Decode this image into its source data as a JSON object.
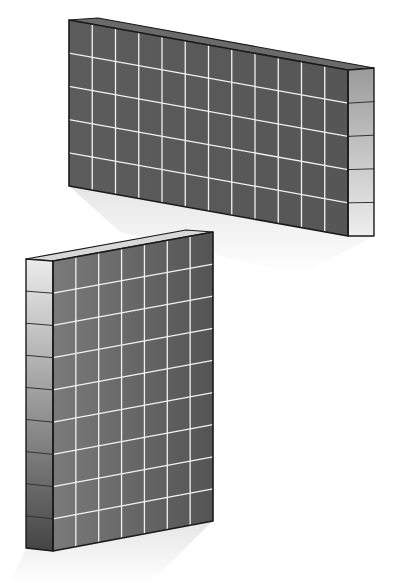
{
  "figure": {
    "width": 400,
    "height": 583,
    "background": "#ffffff",
    "outline_color": "#1a1a1a",
    "grid_line_color": "#f2f2f2",
    "side_divider_color": "#333333"
  },
  "panels": [
    {
      "id": "landscape-panel",
      "orientation": "landscape",
      "columns": 12,
      "rows": 5,
      "front": {
        "tl": [
          69,
          20
        ],
        "tr": [
          348,
          70
        ],
        "br": [
          348,
          236
        ],
        "bl": [
          69,
          186
        ],
        "fill_start": "#5c5c5c",
        "fill_end": "#565656"
      },
      "top_edge": {
        "points": [
          [
            69,
            20
          ],
          [
            98,
            18
          ],
          [
            374,
            68
          ],
          [
            348,
            70
          ]
        ],
        "fill": "#6a6a6a"
      },
      "side": {
        "position": "right",
        "tl": [
          348,
          70
        ],
        "tr": [
          374,
          68
        ],
        "br": [
          374,
          236
        ],
        "bl": [
          348,
          236
        ],
        "segments": 5,
        "fill_top": "#9a9a9a",
        "fill_bottom": "#eeeeee"
      },
      "shadow": {
        "points": [
          [
            69,
            186
          ],
          [
            348,
            236
          ],
          [
            374,
            236
          ],
          [
            300,
            275
          ],
          [
            120,
            232
          ]
        ],
        "opacity": 0.1
      }
    },
    {
      "id": "portrait-panel",
      "orientation": "portrait",
      "columns": 7,
      "rows": 9,
      "front": {
        "tl": [
          53,
          261
        ],
        "tr": [
          213,
          232
        ],
        "br": [
          213,
          521
        ],
        "bl": [
          53,
          551
        ],
        "fill_start": "#7a7a7a",
        "fill_end": "#545454"
      },
      "top_edge": {
        "points": [
          [
            26,
            259
          ],
          [
            186,
            230
          ],
          [
            213,
            232
          ],
          [
            53,
            261
          ]
        ],
        "fill": "#d8d8d8"
      },
      "side": {
        "position": "left",
        "tl": [
          26,
          259
        ],
        "tr": [
          53,
          261
        ],
        "br": [
          53,
          551
        ],
        "bl": [
          26,
          548
        ],
        "segments": 9,
        "fill_top": "#ececec",
        "fill_bottom": "#444444"
      },
      "shadow": {
        "points": [
          [
            26,
            548
          ],
          [
            53,
            551
          ],
          [
            213,
            521
          ],
          [
            150,
            583
          ],
          [
            10,
            583
          ]
        ],
        "opacity": 0.1
      }
    }
  ]
}
